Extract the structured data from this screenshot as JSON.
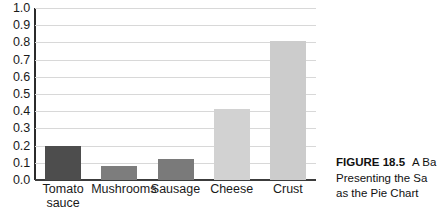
{
  "chart_data": {
    "type": "bar",
    "title": "",
    "xlabel": "",
    "ylabel": "",
    "ylim": [
      0.0,
      1.0
    ],
    "ytick_step": 0.1,
    "grid": true,
    "legend": "none",
    "categories": [
      "Tomato\nsauce",
      "Mushrooms",
      "Sausage",
      "Cheese",
      "Crust"
    ],
    "values": [
      0.2,
      0.08,
      0.12,
      0.41,
      0.81
    ],
    "ytick_labels": [
      "1.0",
      "0.9",
      "0.8",
      "0.7",
      "0.6",
      "0.5",
      "0.4",
      "0.3",
      "0.2",
      "0.1",
      "0.0"
    ],
    "bar_colors": [
      "#4d4d4d",
      "#7d7d7d",
      "#7a7a7a",
      "#d2d2d2",
      "#cccccc"
    ]
  },
  "caption": {
    "figure_label": "FIGURE 18.5",
    "line1_rest": "A Ba",
    "line2": "Presenting the Sa",
    "line3": "as the Pie Chart"
  }
}
